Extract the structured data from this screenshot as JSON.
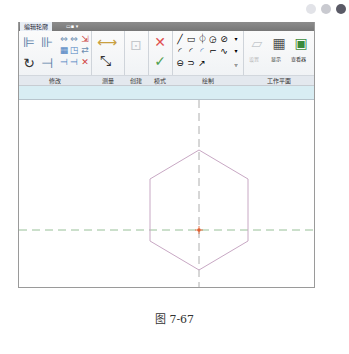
{
  "window_controls": [
    {
      "name": "dot-1",
      "color": "#e2e3e8"
    },
    {
      "name": "dot-2",
      "color": "#c9cad0"
    },
    {
      "name": "dot-3",
      "color": "#5a5a66"
    }
  ],
  "tabs": {
    "active": "编辑轮廓",
    "inactive": "▭▪ ▾"
  },
  "ribbon": {
    "panels": [
      {
        "id": "modify",
        "label": "修改"
      },
      {
        "id": "measure",
        "label": "测量"
      },
      {
        "id": "create",
        "label": "创建"
      },
      {
        "id": "mode",
        "label": "模式"
      },
      {
        "id": "draw",
        "label": "绘制"
      },
      {
        "id": "workplane",
        "label": "工作平面"
      }
    ],
    "workplane_buttons": {
      "set": "设置",
      "show": "显示",
      "viewer": "查看器"
    },
    "icons": {
      "modify": [
        "align-icon",
        "offset-icon",
        "copy-icon",
        "move-icon",
        "pin-icon",
        "array-icon",
        "scale-icon",
        "unpin-icon",
        "rotate-icon",
        "trim-icon",
        "split-icon",
        "split-gap-icon",
        "delete-icon"
      ],
      "measure": [
        "aligned-dimension-icon",
        "measure-distance-icon"
      ],
      "create": [
        "create-group-icon"
      ],
      "mode": [
        "cancel-edit-icon",
        "finish-edit-icon"
      ],
      "draw": [
        "line-icon",
        "rectangle-icon",
        "inscribed-polygon-icon",
        "circumscribed-polygon-icon",
        "circle-icon",
        "start-end-arc-icon",
        "center-arc-icon",
        "tangent-arc-icon",
        "fillet-arc-icon",
        "spline-icon",
        "ellipse-icon",
        "partial-ellipse-icon",
        "pick-lines-icon"
      ]
    }
  },
  "canvas": {
    "shape": "hexagon",
    "colors": {
      "hexagon": "#c8a8c4",
      "reference_line": "#9a9a9a",
      "horizontal_ref": "#7fb07f",
      "center_point": "#e06030"
    }
  },
  "caption": "图 7-67"
}
